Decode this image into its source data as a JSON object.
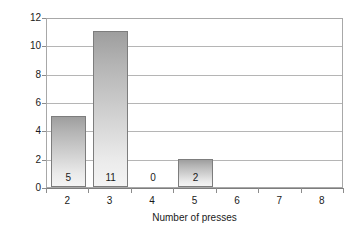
{
  "chart_data": {
    "type": "bar",
    "title": "",
    "xlabel": "Number of presses",
    "ylabel": "Number of sites",
    "categories": [
      "2",
      "3",
      "4",
      "5",
      "6",
      "7",
      "8"
    ],
    "values": [
      5,
      11,
      0,
      2,
      0,
      0,
      0
    ],
    "data_labels": [
      "5",
      "11",
      "0",
      "2",
      "",
      "",
      ""
    ],
    "ylim": [
      0,
      12
    ],
    "ytick_labels": [
      "0",
      "2",
      "4",
      "6",
      "8",
      "10",
      "12"
    ],
    "ytick_values": [
      0,
      2,
      4,
      6,
      8,
      10,
      12
    ],
    "xtick_labels": [
      "2",
      "3",
      "4",
      "5",
      "6",
      "7",
      "8"
    ],
    "grid": "horizontal",
    "legend": "none",
    "colors": {
      "bar_top": "#9e9e9e",
      "bar_bottom": "#f4f4f4",
      "bar_border": "#7d7d7d",
      "gridline": "#b5b5b5",
      "plot_border": "#a8a8a8",
      "axis": "#7d7d7d",
      "text": "#1a1a1a",
      "background": "#ffffff"
    }
  }
}
